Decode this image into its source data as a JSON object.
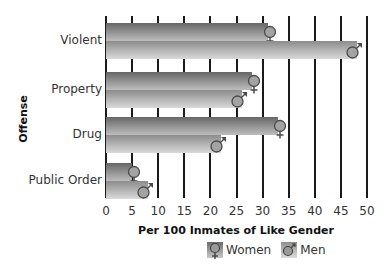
{
  "chart_data": {
    "type": "bar",
    "orientation": "horizontal",
    "title": "",
    "xlabel": "Per 100 Inmates of Like Gender",
    "ylabel": "Offense",
    "categories": [
      "Violent",
      "Property",
      "Drug",
      "Public Order"
    ],
    "series": [
      {
        "name": "Women",
        "symbol": "female-symbol",
        "values": [
          31,
          28,
          33,
          5
        ]
      },
      {
        "name": "Men",
        "symbol": "male-symbol",
        "values": [
          48,
          26,
          22,
          8
        ]
      }
    ],
    "xlim": [
      0,
      50
    ],
    "xticks": [
      "0",
      "5",
      "10",
      "15",
      "20",
      "25",
      "30",
      "35",
      "40",
      "45",
      "50"
    ],
    "grid": true,
    "legend_position": "bottom"
  },
  "legend": {
    "women_label": "Women",
    "men_label": "Men"
  },
  "colors": {
    "women_bar_top": "#666666",
    "women_bar_bottom": "#bdbdbd",
    "men_bar_top": "#8c8c8c",
    "men_bar_bottom": "#d9d9d9",
    "gridline": "#1a1a1a"
  }
}
